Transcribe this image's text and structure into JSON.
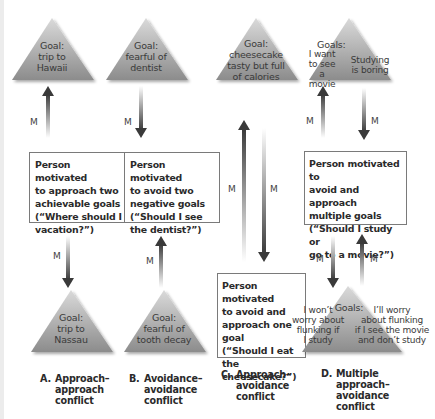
{
  "colors": {
    "triangle_light": "#d2d2d2",
    "triangle_dark": "#8f8f8f",
    "arrow_dark": "#3c3c3c",
    "box_border": "#7a7a7a",
    "text": "#2a2a2a"
  },
  "motivation_label": "M",
  "columns": [
    {
      "id": "A",
      "top_goal": [
        "Goal:",
        "trip to",
        "Hawaii"
      ],
      "box": [
        "Person motivated",
        "to approach two",
        "achievable goals",
        "(“Where should I",
        "vacation?”)"
      ],
      "bottom_goal": [
        "Goal:",
        "trip to",
        "Nassau"
      ],
      "label_letter": "A.",
      "label": [
        "Approach–",
        "approach",
        "conflict"
      ]
    },
    {
      "id": "B",
      "top_goal": [
        "Goal:",
        "fearful of",
        "dentist"
      ],
      "box": [
        "Person motivated",
        "to avoid two",
        "negative goals",
        "(“Should I see",
        "the dentist?”)"
      ],
      "bottom_goal": [
        "Goal:",
        "fearful of",
        "tooth decay"
      ],
      "label_letter": "B.",
      "label": [
        "Avoidance–",
        "avoidance",
        "conflict"
      ]
    },
    {
      "id": "C",
      "top_goal": [
        "Goal:",
        "cheesecake",
        "tasty but full",
        "of calories"
      ],
      "box": [
        "Person motivated",
        "to avoid and",
        "approach one",
        "goal",
        "(“Should I eat the",
        "cheesecake?”)"
      ],
      "label_letter": "C.",
      "label": [
        "Approach–",
        "avoidance",
        "conflict"
      ]
    },
    {
      "id": "D",
      "top_goal_heading": "Goals:",
      "top_goal_left": [
        "I want",
        "to see",
        "a movie"
      ],
      "top_goal_right": [
        "Studying",
        "is boring"
      ],
      "box": [
        "Person motivated to",
        "avoid and approach",
        "multiple goals",
        "(“Should I study or",
        "go to a movie?”)"
      ],
      "bottom_goal_heading": "Goals:",
      "bottom_goal_left": [
        "I won’t",
        "worry about",
        "flunking if",
        "I study"
      ],
      "bottom_goal_right": [
        "I’ll worry",
        "about flunking",
        "if I see the movie",
        "and don’t study"
      ],
      "label_letter": "D.",
      "label": [
        "Multiple",
        "approach–",
        "avoidance",
        "conflict"
      ]
    }
  ]
}
